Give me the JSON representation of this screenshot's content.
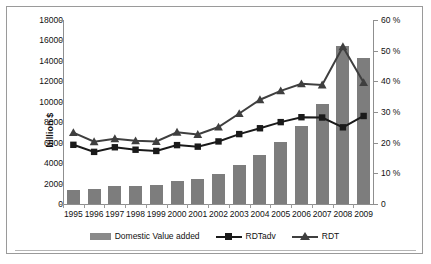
{
  "chart_data": {
    "type": "bar",
    "title": "",
    "xlabel": "",
    "ylabel": "billion $",
    "y2label": "",
    "categories": [
      "1995",
      "1996",
      "1997",
      "1998",
      "1999",
      "2000",
      "2001",
      "2002",
      "2003",
      "2004",
      "2005",
      "2006",
      "2007",
      "2008",
      "2009"
    ],
    "ylim": [
      0,
      18000
    ],
    "y2lim": [
      0,
      60
    ],
    "yticks": [
      "18000",
      "16000",
      "14000",
      "12000",
      "10000",
      "8000",
      "6000",
      "4000",
      "2000",
      "0"
    ],
    "y2ticks": [
      "60 %",
      "50 %",
      "40 %",
      "30 %",
      "20 %",
      "10 %",
      "0"
    ],
    "grid": false,
    "legend_position": "bottom",
    "series": [
      {
        "name": "Domestic Value added",
        "type": "bar",
        "axis": "left",
        "unit": "billion $",
        "color": "#7d7d7d",
        "values": [
          1400,
          1480,
          1780,
          1800,
          1840,
          2270,
          2470,
          2970,
          3770,
          4770,
          6050,
          7650,
          9770,
          15500,
          14300
        ]
      },
      {
        "name": "RDTadv",
        "type": "line",
        "marker": "square",
        "axis": "right",
        "unit": "%",
        "color": "#1a1a1a",
        "values": [
          19.3,
          17.0,
          18.5,
          17.7,
          17.3,
          19.2,
          18.7,
          20.4,
          22.8,
          24.7,
          26.7,
          28.3,
          28.2,
          25.0,
          28.7
        ]
      },
      {
        "name": "RDT",
        "type": "line",
        "marker": "triangle",
        "axis": "right",
        "unit": "%",
        "color": "#3f3f3f",
        "values": [
          23.3,
          20.3,
          21.3,
          20.6,
          20.4,
          23.4,
          22.7,
          25.1,
          29.5,
          34.0,
          36.9,
          39.2,
          38.8,
          51.3,
          39.6
        ]
      }
    ],
    "legend": [
      {
        "label": "Domestic Value added",
        "icon": "bar-swatch"
      },
      {
        "label": "RDTadv",
        "icon": "line-square-swatch"
      },
      {
        "label": "RDT",
        "icon": "line-triangle-swatch"
      }
    ]
  }
}
